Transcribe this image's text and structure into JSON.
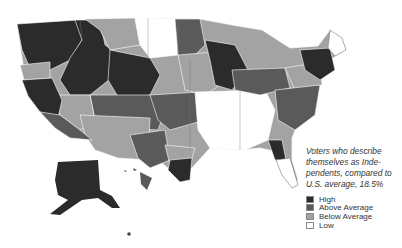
{
  "map": {
    "title": "Voters who describe themselves as Independents, compared to U.S. average, 18.5%",
    "legend": {
      "title_lines": [
        "Voters who describe",
        "themselves as Inde-",
        "pendents, compared to",
        "U.S. average, 18.5%"
      ],
      "items": [
        {
          "label": "High",
          "color": "#2b2b2b"
        },
        {
          "label": "Above Average",
          "color": "#5a5a5a"
        },
        {
          "label": "Below Average",
          "color": "#a3a3a3"
        },
        {
          "label": "Low",
          "color": "#ffffff"
        }
      ]
    },
    "regions": [
      {
        "name": "pacific-northwest",
        "level": "High"
      },
      {
        "name": "oregon-coast-band",
        "level": "Below Average"
      },
      {
        "name": "idaho-montana-west",
        "level": "High"
      },
      {
        "name": "montana-east",
        "level": "Below Average"
      },
      {
        "name": "north-dakota",
        "level": "Low"
      },
      {
        "name": "minnesota-north",
        "level": "Above Average"
      },
      {
        "name": "wyoming",
        "level": "High"
      },
      {
        "name": "colorado-utah",
        "level": "Above Average"
      },
      {
        "name": "nevada-south",
        "level": "Below Average"
      },
      {
        "name": "arizona-new-mexico",
        "level": "Below Average"
      },
      {
        "name": "california-north",
        "level": "High"
      },
      {
        "name": "california-south",
        "level": "Above Average"
      },
      {
        "name": "texas-west",
        "level": "Above Average"
      },
      {
        "name": "texas-central",
        "level": "Below Average"
      },
      {
        "name": "texas-east",
        "level": "High"
      },
      {
        "name": "kansas-oklahoma",
        "level": "Above Average"
      },
      {
        "name": "iowa-missouri",
        "level": "Below Average"
      },
      {
        "name": "deep-south",
        "level": "Low"
      },
      {
        "name": "wisconsin-michigan",
        "level": "High"
      },
      {
        "name": "ohio-indiana",
        "level": "Above Average"
      },
      {
        "name": "pennsylvania",
        "level": "Below Average"
      },
      {
        "name": "appalachia-east",
        "level": "Above Average"
      },
      {
        "name": "new-england",
        "level": "High"
      },
      {
        "name": "maine",
        "level": "Low"
      },
      {
        "name": "florida-north",
        "level": "High"
      },
      {
        "name": "florida-peninsula",
        "level": "Low"
      },
      {
        "name": "alaska",
        "level": "High"
      },
      {
        "name": "hawaii",
        "level": "Above Average"
      }
    ]
  }
}
